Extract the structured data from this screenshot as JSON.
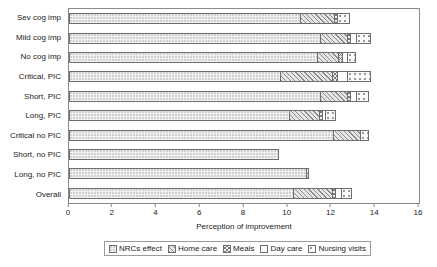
{
  "chart_data": {
    "type": "bar",
    "orientation": "horizontal",
    "stacked": true,
    "title": "",
    "xlabel": "Perception of improvement",
    "ylabel": "",
    "xlim": [
      0,
      16
    ],
    "xticks": [
      0,
      2,
      4,
      6,
      8,
      10,
      12,
      14,
      16
    ],
    "grid": false,
    "legend_position": "bottom",
    "categories": [
      "Sev cog imp",
      "Mild cog imp",
      "No cog imp",
      "Critical, PIC",
      "Short, PIC",
      "Long, PIC",
      "Critical no PIC",
      "Short, no PIC",
      "Long, no PIC",
      "Overall"
    ],
    "series": [
      {
        "name": "NRCs effect",
        "pattern": "fine-dot",
        "values": [
          10.6,
          11.5,
          11.4,
          9.7,
          11.5,
          10.1,
          12.1,
          9.6,
          10.9,
          10.3
        ]
      },
      {
        "name": "Home care",
        "pattern": "diagonal-hatch",
        "values": [
          1.6,
          1.3,
          1.0,
          2.4,
          1.3,
          1.4,
          1.3,
          0.0,
          0.1,
          1.8
        ]
      },
      {
        "name": "Meals",
        "pattern": "cross-hatch",
        "values": [
          0.2,
          0.2,
          0.2,
          0.3,
          0.2,
          0.2,
          0.0,
          0.0,
          0.0,
          0.2
        ]
      },
      {
        "name": "Day care",
        "pattern": "solid-white",
        "values": [
          0.0,
          0.3,
          0.3,
          0.5,
          0.3,
          0.2,
          0.0,
          0.0,
          0.0,
          0.3
        ]
      },
      {
        "name": "Nursing visits",
        "pattern": "coarse-dot",
        "values": [
          0.6,
          0.7,
          0.4,
          1.1,
          0.6,
          0.5,
          0.4,
          0.0,
          0.0,
          0.5
        ]
      }
    ],
    "totals": [
      13.0,
      14.0,
      13.3,
      14.0,
      13.9,
      12.4,
      13.8,
      9.6,
      11.0,
      13.1
    ]
  },
  "legend": {
    "items": [
      {
        "label": "NRCs effect"
      },
      {
        "label": "Home care"
      },
      {
        "label": "Meals"
      },
      {
        "label": "Day care"
      },
      {
        "label": "Nursing visits"
      }
    ]
  }
}
